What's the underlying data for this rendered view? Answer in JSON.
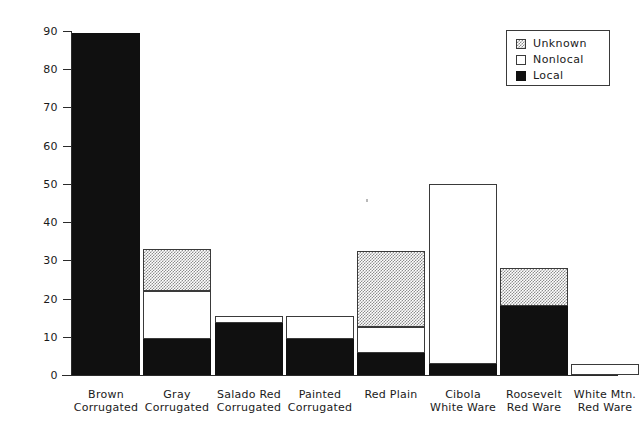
{
  "chart_data": {
    "type": "bar",
    "subtype": "stacked-vertical",
    "title": "",
    "xlabel": "",
    "ylabel": "Number of Vessels",
    "ylim": [
      0,
      90
    ],
    "yticks": [
      0,
      10,
      20,
      30,
      40,
      50,
      60,
      70,
      80,
      90
    ],
    "ytick_labels": [
      "0",
      "10",
      "20",
      "30",
      "40",
      "50",
      "60",
      "70",
      "80",
      "90"
    ],
    "grid": false,
    "legend_position": "top-right",
    "categories": [
      "Brown Corrugated",
      "Gray Corrugated",
      "Salado Red Corrugated",
      "Painted Corrugated",
      "Red Plain",
      "Cibola White Ware",
      "Roosevelt Red Ware",
      "White Mtn. Red Ware"
    ],
    "category_lines": [
      [
        "Brown",
        "Corrugated"
      ],
      [
        "Gray",
        "Corrugated"
      ],
      [
        "Salado Red",
        "Corrugated"
      ],
      [
        "Painted",
        "Corrugated"
      ],
      [
        "Red Plain",
        ""
      ],
      [
        "Cibola",
        "White Ware"
      ],
      [
        "Roosevelt",
        "Red Ware"
      ],
      [
        "White Mtn.",
        "Red Ware"
      ]
    ],
    "series": [
      {
        "name": "Local",
        "color": "#101010",
        "pattern": "solid-black",
        "values": [
          89.5,
          9.5,
          13.5,
          9.5,
          5.8,
          2.8,
          18.0,
          0.0
        ]
      },
      {
        "name": "Nonlocal",
        "color": "#ffffff",
        "pattern": "solid-white",
        "values": [
          0.0,
          12.5,
          2.0,
          6.0,
          6.7,
          47.2,
          0.0,
          3.0
        ]
      },
      {
        "name": "Unknown",
        "color": "#d8d8d8",
        "pattern": "stipple",
        "values": [
          0.0,
          11.0,
          0.0,
          0.0,
          20.0,
          0.0,
          10.0,
          0.0
        ]
      }
    ],
    "totals": [
      89.5,
      33.0,
      15.5,
      15.5,
      32.5,
      50.0,
      28.0,
      3.0
    ]
  },
  "legend": {
    "items": [
      {
        "label": "Unknown",
        "swatch": "stipple-swatch"
      },
      {
        "label": "Nonlocal",
        "swatch": "white-swatch"
      },
      {
        "label": "Local",
        "swatch": "black-swatch"
      }
    ]
  },
  "axes": {
    "y_title": "Number of Vessels"
  }
}
